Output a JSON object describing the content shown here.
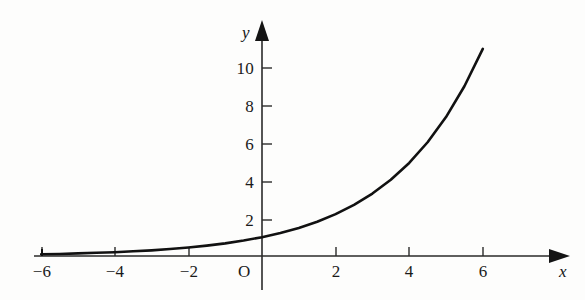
{
  "figure": {
    "background_color": "#fdfdfc",
    "axis_color": "#1a1a1a",
    "curve_color": "#111111",
    "origin_label": "O",
    "x_axis_name": "x",
    "y_axis_name": "y"
  },
  "chart_data": {
    "type": "line",
    "title": "",
    "xlabel": "x",
    "ylabel": "y",
    "xlim": [
      -6.8,
      7.6
    ],
    "ylim": [
      -0.6,
      12.8
    ],
    "xticks": [
      -6,
      -4,
      -2,
      0,
      2,
      4,
      6
    ],
    "xtick_labels": [
      "−6",
      "−4",
      "−2",
      "O",
      "2",
      "4",
      "6"
    ],
    "yticks": [
      2,
      4,
      6,
      8,
      10
    ],
    "ytick_labels": [
      "2",
      "4",
      "6",
      "8",
      "10"
    ],
    "grid": false,
    "legend": null,
    "series": [
      {
        "name": "exponential curve",
        "equation": "y = e^(0.4x)",
        "x": [
          -6,
          -5.5,
          -5,
          -4.5,
          -4,
          -3.5,
          -3,
          -2.5,
          -2,
          -1.5,
          -1,
          -0.5,
          0,
          0.5,
          1,
          1.5,
          2,
          2.5,
          3,
          3.5,
          4,
          4.5,
          5,
          5.5,
          6
        ],
        "y": [
          0.09,
          0.11,
          0.14,
          0.17,
          0.2,
          0.25,
          0.3,
          0.37,
          0.45,
          0.55,
          0.67,
          0.82,
          1.0,
          1.22,
          1.49,
          1.82,
          2.23,
          2.72,
          3.32,
          4.06,
          4.95,
          6.05,
          7.39,
          9.03,
          11.02
        ]
      }
    ],
    "annotations": [
      {
        "text": "arrowhead at positive x end",
        "x": 7.4,
        "y": 0
      },
      {
        "text": "arrowhead at positive y end",
        "x": 0,
        "y": 12.4
      }
    ]
  },
  "axis_labels": {
    "x": [
      {
        "id": "x-neg-6",
        "text": "−6",
        "px": 42
      },
      {
        "id": "x-neg-4",
        "text": "−4",
        "px": 115
      },
      {
        "id": "x-neg-2",
        "text": "−2",
        "px": 189
      },
      {
        "id": "x-origin",
        "text": "O",
        "px": 245
      },
      {
        "id": "x-pos-2",
        "text": "2",
        "px": 336
      },
      {
        "id": "x-pos-4",
        "text": "4",
        "px": 409
      },
      {
        "id": "x-pos-6",
        "text": "6",
        "px": 483
      }
    ],
    "y": [
      {
        "id": "y-2",
        "text": "2",
        "px": 220
      },
      {
        "id": "y-4",
        "text": "4",
        "px": 182
      },
      {
        "id": "y-6",
        "text": "6",
        "px": 144
      },
      {
        "id": "y-8",
        "text": "8",
        "px": 106
      },
      {
        "id": "y-10",
        "text": "10",
        "px": 68
      }
    ]
  }
}
